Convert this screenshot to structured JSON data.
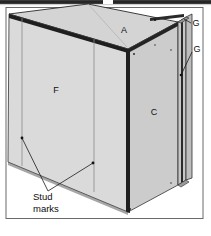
{
  "figure": {
    "background_color": "#ffffff",
    "frame_color": "#5a5a5a",
    "top_bar_color": "#2b2b2b",
    "panel_face_color": "#d9d9d9",
    "panel_top_color": "#d2d2d2",
    "panel_side_color": "#cacaca",
    "edge_dark_color": "#1c1c1c",
    "stud_line_color": "#6e6e6e",
    "leader_color": "#1a1a1a"
  },
  "labels": {
    "top_face": "A",
    "right_face": "C",
    "front_face": "F",
    "right_edge_upper": "G",
    "right_edge_lower": "G"
  },
  "callouts": {
    "stud_marks": {
      "line1": "Stud",
      "line2": "marks"
    }
  },
  "geometry": {
    "front_face_corners": "9,14 128,49 128,212 8,162",
    "top_face_corners": "9,14 88,4 178,22 128,49",
    "right_face_corners": "128,49 178,22 178,185 128,212",
    "stud_mark_x_left": 38,
    "stud_mark_x_right": 94,
    "leader_dot_left": "22,138",
    "leader_dot_right": "93,163",
    "leader_converge": "48,191"
  }
}
